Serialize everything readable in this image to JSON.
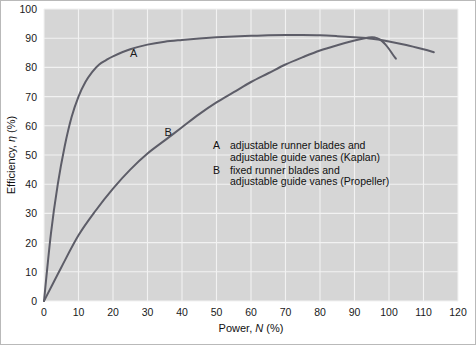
{
  "chart_data": {
    "type": "line",
    "title": "",
    "xlabel": "Power, N (%)",
    "xlabel_plain": "Power,",
    "xlabel_symbol": "N",
    "xlabel_unit": "(%)",
    "ylabel": "Efficiency, η (%)",
    "ylabel_plain": "Efficiency,",
    "ylabel_symbol": "η",
    "ylabel_unit": "(%)",
    "xlim": [
      0,
      120
    ],
    "ylim": [
      0,
      100
    ],
    "xticks": [
      0,
      10,
      20,
      30,
      40,
      50,
      60,
      70,
      80,
      90,
      100,
      110,
      120
    ],
    "yticks": [
      0,
      10,
      20,
      30,
      40,
      50,
      60,
      70,
      80,
      90,
      100
    ],
    "grid": true,
    "legend_position": "inside-center-right",
    "plot_background": "#d6d6d6",
    "gridline_color": "#f2f2f2",
    "curve_color": "#5d5d68",
    "series": [
      {
        "name": "A",
        "label": "A",
        "label_x": 26,
        "label_y": 83.5,
        "x": [
          0,
          2,
          4,
          6,
          8,
          10,
          12,
          14,
          16,
          18,
          20,
          25,
          30,
          35,
          40,
          45,
          50,
          55,
          60,
          65,
          70,
          75,
          80,
          85,
          90,
          95,
          100,
          105,
          110,
          113
        ],
        "y": [
          0,
          23,
          40,
          53,
          63,
          70,
          75,
          78.5,
          81,
          82.5,
          83.8,
          86.2,
          87.8,
          88.8,
          89.4,
          89.9,
          90.3,
          90.6,
          90.8,
          91.0,
          91.1,
          91.1,
          91.0,
          90.7,
          90.3,
          89.8,
          88.9,
          87.7,
          86.2,
          85.2
        ]
      },
      {
        "name": "B",
        "label": "B",
        "label_x": 36,
        "label_y": 56.5,
        "x": [
          0,
          5,
          10,
          15,
          20,
          25,
          30,
          35,
          40,
          45,
          50,
          55,
          60,
          65,
          70,
          75,
          80,
          85,
          90,
          93,
          95,
          96,
          97,
          98,
          99,
          100,
          101,
          102
        ],
        "y": [
          0,
          11.5,
          22.5,
          31,
          38.5,
          45,
          50.5,
          55,
          59.5,
          64,
          68,
          71.5,
          75,
          78,
          81,
          83.5,
          85.8,
          87.6,
          89.2,
          90.0,
          90.3,
          90.2,
          89.8,
          89.0,
          87.8,
          86.3,
          84.6,
          83.0
        ]
      }
    ],
    "legend": [
      {
        "key": "A",
        "line1": "adjustable runner blades and",
        "line2": "adjustable guide vanes (Kaplan)"
      },
      {
        "key": "B",
        "line1": "fixed runner blades and",
        "line2": "adjustable guide vanes (Propeller)"
      }
    ]
  }
}
